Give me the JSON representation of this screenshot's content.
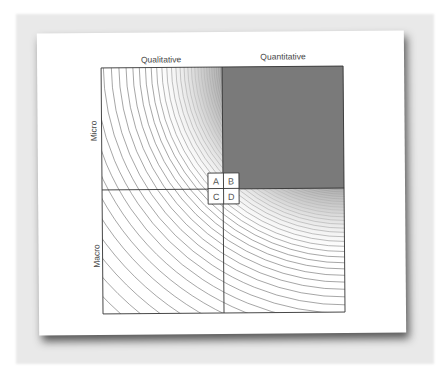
{
  "diagram": {
    "columns": [
      {
        "label": "Qualitative"
      },
      {
        "label": "Quantitative"
      }
    ],
    "rows": [
      {
        "label": "Micro"
      },
      {
        "label": "Macro"
      }
    ],
    "cells": [
      {
        "label": "A",
        "position": "top-left"
      },
      {
        "label": "B",
        "position": "top-right"
      },
      {
        "label": "C",
        "position": "bottom-left"
      },
      {
        "label": "D",
        "position": "bottom-right"
      }
    ],
    "highlighted_quadrant": "Quantitative / Micro",
    "colors": {
      "highlight_fill": "#7a7a7a",
      "line": "#333333",
      "arc": "#6a6a6a",
      "card": "#ffffff",
      "backdrop": "#e9e9e9"
    }
  }
}
